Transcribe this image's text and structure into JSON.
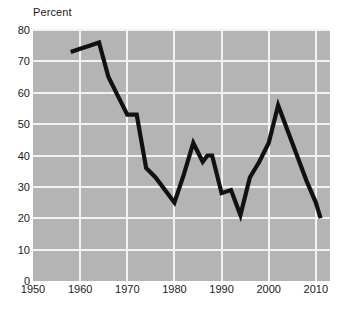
{
  "chart_data": {
    "type": "line",
    "title": "",
    "subtitle": "",
    "xlabel": "",
    "ylabel": "Percent",
    "ylim": [
      0,
      80
    ],
    "xlim": [
      1950,
      2013
    ],
    "grid": true,
    "legend": null,
    "ytick_labels": [
      "80",
      "70",
      "60",
      "50",
      "40",
      "30",
      "20",
      "10",
      "0"
    ],
    "ytick_values": [
      80,
      70,
      60,
      50,
      40,
      30,
      20,
      10,
      0
    ],
    "xtick_labels": [
      "1950",
      "1960",
      "1970",
      "1980",
      "1990",
      "2000",
      "2010"
    ],
    "xtick_values": [
      1950,
      1960,
      1970,
      1980,
      1990,
      2000,
      2010
    ],
    "series": [
      {
        "name": "Percent",
        "color": "#111111",
        "x": [
          1958,
          1960,
          1962,
          1964,
          1966,
          1968,
          1970,
          1972,
          1974,
          1976,
          1978,
          1980,
          1982,
          1984,
          1986,
          1987,
          1988,
          1990,
          1992,
          1994,
          1996,
          1998,
          2000,
          2002,
          2004,
          2006,
          2008,
          2010,
          2011
        ],
        "values": [
          73,
          74,
          75,
          76,
          65,
          59,
          53,
          53,
          36,
          33,
          29,
          25,
          34,
          44,
          38,
          40,
          40,
          28,
          29,
          21,
          33,
          38,
          44,
          56,
          48,
          40,
          32,
          25,
          20
        ]
      }
    ]
  },
  "axes": {
    "y_title": "Percent"
  }
}
